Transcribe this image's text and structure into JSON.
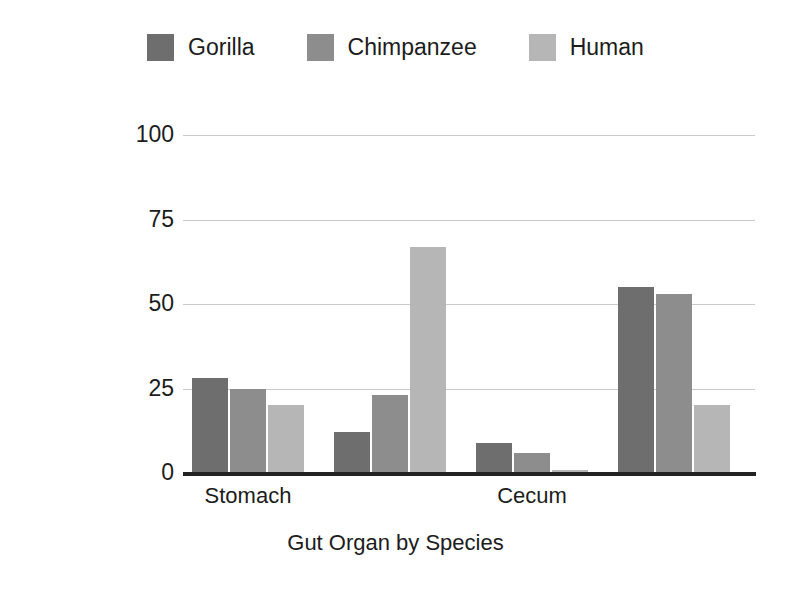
{
  "chart_data": {
    "type": "bar",
    "title": "",
    "xlabel": "Gut Organ by Species",
    "ylabel": "Relative proportion of Gut Volume (%)",
    "ylim": [
      0,
      100
    ],
    "yticks": [
      0,
      25,
      50,
      75,
      100
    ],
    "grid": true,
    "legend_position": "top-center",
    "grouped": true,
    "categories": [
      "Stomach",
      "",
      "Cecum",
      ""
    ],
    "group_labels_visible": [
      "Stomach",
      "Cecum"
    ],
    "series": [
      {
        "name": "Gorilla",
        "color": "#6e6e6e",
        "values": [
          28,
          12,
          9,
          55
        ]
      },
      {
        "name": "Chimpanzee",
        "color": "#8d8d8d",
        "values": [
          25,
          23,
          6,
          53
        ]
      },
      {
        "name": "Human",
        "color": "#b6b6b6",
        "values": [
          20,
          67,
          1,
          20
        ]
      }
    ]
  },
  "legend": {
    "items": [
      {
        "label": "Gorilla",
        "color": "#6e6e6e"
      },
      {
        "label": "Chimpanzee",
        "color": "#8d8d8d"
      },
      {
        "label": "Human",
        "color": "#b6b6b6"
      }
    ]
  },
  "axes": {
    "y_title": "Relative proportion of Gut Volume (%)",
    "x_title": "Gut Organ by Species",
    "y_tick_labels": [
      "100",
      "75",
      "50",
      "25",
      "0"
    ],
    "x_group_labels": [
      "Stomach",
      "Cecum"
    ]
  },
  "colors": {
    "gridline": "#c9c9c9",
    "axis": "#232323",
    "background": "#ffffff",
    "text": "#1c1c1c"
  }
}
